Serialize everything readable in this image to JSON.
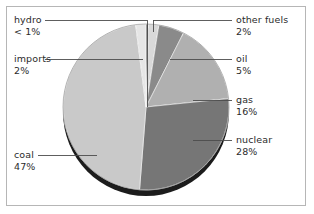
{
  "figure": {
    "border_color": "#b6b6b6",
    "background": "#ffffff"
  },
  "chart_data": {
    "type": "pie",
    "title": "",
    "subtitle": "",
    "xlabel": "",
    "ylabel": "",
    "legend_position": "callout-labels",
    "grid": false,
    "start_angle_deg": 0,
    "direction": "clockwise",
    "categories": [
      "hydro",
      "other fuels",
      "oil",
      "gas",
      "nuclear",
      "coal",
      "imports"
    ],
    "values": [
      0.5,
      2,
      5,
      16,
      28,
      47,
      2
    ],
    "value_labels": [
      "< 1%",
      "2%",
      "5%",
      "16%",
      "28%",
      "47%",
      "2%"
    ],
    "colors": [
      "#3a3a3a",
      "#d9d9d9",
      "#8a8a8a",
      "#b0b0b0",
      "#767676",
      "#c9c9c9",
      "#e6e6e6"
    ],
    "slices": [
      {
        "name": "hydro",
        "value": 0.5,
        "value_label": "< 1%",
        "color": "#3a3a3a"
      },
      {
        "name": "other fuels",
        "value": 2,
        "value_label": "2%",
        "color": "#d9d9d9"
      },
      {
        "name": "oil",
        "value": 5,
        "value_label": "5%",
        "color": "#8a8a8a"
      },
      {
        "name": "gas",
        "value": 16,
        "value_label": "16%",
        "color": "#b0b0b0"
      },
      {
        "name": "nuclear",
        "value": 28,
        "value_label": "28%",
        "color": "#767676"
      },
      {
        "name": "coal",
        "value": 47,
        "value_label": "47%",
        "color": "#c9c9c9"
      },
      {
        "name": "imports",
        "value": 2,
        "value_label": "2%",
        "color": "#e6e6e6"
      }
    ]
  },
  "callouts": {
    "hydro": {
      "name": "hydro",
      "value": "< 1%"
    },
    "imports": {
      "name": "imports",
      "value": "2%"
    },
    "coal": {
      "name": "coal",
      "value": "47%"
    },
    "other_fuels": {
      "name": "other fuels",
      "value": "2%"
    },
    "oil": {
      "name": "oil",
      "value": "5%"
    },
    "gas": {
      "name": "gas",
      "value": "16%"
    },
    "nuclear": {
      "name": "nuclear",
      "value": "28%"
    }
  }
}
